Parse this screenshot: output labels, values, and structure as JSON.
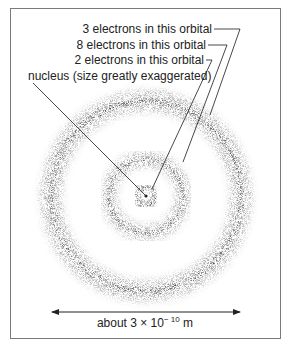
{
  "diagram": {
    "type": "atomic-orbital-model",
    "labels": {
      "orbital3": "3 electrons in this orbital",
      "orbital2": "8 electrons in this orbital",
      "orbital1": "2 electrons in this orbital",
      "nucleus": "nucleus (size greatly exaggerated)"
    },
    "scale": {
      "prefix": "about 3 × 10",
      "exponent": "− 10",
      "unit": "m"
    },
    "orbitals": [
      {
        "name": "inner",
        "electrons": 2,
        "radius": 9
      },
      {
        "name": "middle",
        "electrons": 8,
        "radius": 37
      },
      {
        "name": "outer",
        "electrons": 3,
        "radius": 95
      }
    ],
    "colors": {
      "ink": "#222222",
      "border": "#7a7a7a"
    }
  }
}
